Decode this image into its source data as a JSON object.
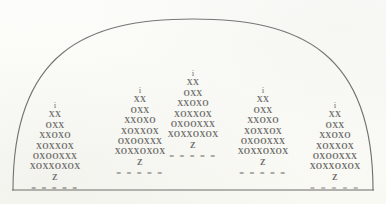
{
  "figure": {
    "background_color": "#fbfbf7",
    "ink_color": "#2a2a2a",
    "outline": {
      "name": "dome-arch-outline",
      "stroke_color": "#2f2f2f",
      "stroke_width": 1.1,
      "baseline_y": 190,
      "left_foot_x": 13,
      "right_foot_x": 373,
      "apex_x": 193,
      "apex_y": 19
    },
    "pyramid_rows": [
      "i",
      "XX",
      "OXX",
      "XXOXO",
      "XOXXOX",
      "OXOOXXX",
      "XOXXOXOX",
      "Z",
      "= = = = ="
    ],
    "columns": [
      {
        "id": "column-1",
        "center_x": 55,
        "top_y": 100,
        "heavy_base": false
      },
      {
        "id": "column-2",
        "center_x": 140,
        "top_y": 85,
        "heavy_base": false
      },
      {
        "id": "column-3",
        "center_x": 193,
        "top_y": 68,
        "heavy_base": false
      },
      {
        "id": "column-4",
        "center_x": 263,
        "top_y": 85,
        "heavy_base": false
      },
      {
        "id": "column-5",
        "center_x": 335,
        "top_y": 100,
        "heavy_base": true
      }
    ]
  }
}
